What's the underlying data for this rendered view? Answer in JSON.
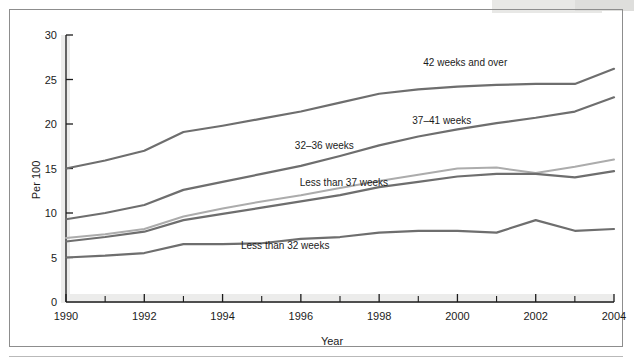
{
  "figure": {
    "background_color": "#ffffff",
    "frame_color": "#8d8d8d",
    "axis_color": "#1b1b1b",
    "shadow_color": "#ececeb"
  },
  "axes": {
    "y_title": "Per 100",
    "x_title": "Year",
    "y_ticks": [
      "0",
      "5",
      "10",
      "15",
      "20",
      "25",
      "30"
    ],
    "x_ticks": [
      "1990",
      "1992",
      "1994",
      "1996",
      "1998",
      "2000",
      "2002",
      "2004"
    ],
    "x_minor_ticks": [
      "1991",
      "1993",
      "1995",
      "1997",
      "1999",
      "2001",
      "2003"
    ]
  },
  "series_labels": {
    "s42": "42 weeks and over",
    "s3741": "37–41 weeks",
    "s3236": "32–36 weeks",
    "slt37": "Less than 37 weeks",
    "slt32": "Less than 32 weeks"
  },
  "chart_data": {
    "type": "line",
    "title": "",
    "xlabel": "Year",
    "ylabel": "Per 100",
    "xlim": [
      1990,
      2004
    ],
    "ylim": [
      0,
      30
    ],
    "grid": false,
    "legend": "inline-annotations",
    "x": [
      1990,
      1991,
      1992,
      1993,
      1994,
      1995,
      1996,
      1997,
      1998,
      1999,
      2000,
      2001,
      2002,
      2003,
      2004
    ],
    "series": [
      {
        "name": "42 weeks and over",
        "color": "#6e6e6e",
        "width": 2.2,
        "values": [
          15.0,
          15.9,
          17.0,
          19.1,
          19.8,
          20.6,
          21.4,
          22.4,
          23.4,
          23.9,
          24.2,
          24.4,
          24.5,
          24.5,
          26.2
        ],
        "label_x": 2000.2,
        "label_y": 26.5
      },
      {
        "name": "37–41 weeks",
        "color": "#6e6e6e",
        "width": 2.2,
        "values": [
          9.3,
          10.0,
          10.9,
          12.6,
          13.5,
          14.4,
          15.3,
          16.4,
          17.6,
          18.6,
          19.4,
          20.1,
          20.7,
          21.4,
          23.0
        ],
        "label_x": 1999.6,
        "label_y": 20.0
      },
      {
        "name": "32–36 weeks",
        "color": "#acacac",
        "width": 2.0,
        "values": [
          7.2,
          7.6,
          8.2,
          9.6,
          10.5,
          11.3,
          12.0,
          12.8,
          13.6,
          14.3,
          15.0,
          15.1,
          14.5,
          15.2,
          16.0
        ],
        "label_x": 1996.6,
        "label_y": 17.2
      },
      {
        "name": "Less than 37 weeks",
        "color": "#6e6e6e",
        "width": 2.2,
        "values": [
          6.8,
          7.3,
          7.9,
          9.2,
          9.9,
          10.6,
          11.3,
          12.0,
          12.9,
          13.5,
          14.1,
          14.4,
          14.4,
          14.0,
          14.7
        ],
        "label_x": 1997.1,
        "label_y": 13.0
      },
      {
        "name": "Less than 32 weeks",
        "color": "#6e6e6e",
        "width": 2.2,
        "values": [
          5.0,
          5.2,
          5.5,
          6.5,
          6.5,
          6.6,
          7.1,
          7.3,
          7.8,
          8.0,
          8.0,
          7.8,
          9.2,
          8.0,
          8.2
        ],
        "label_x": 1995.6,
        "label_y": 6.0
      }
    ]
  }
}
